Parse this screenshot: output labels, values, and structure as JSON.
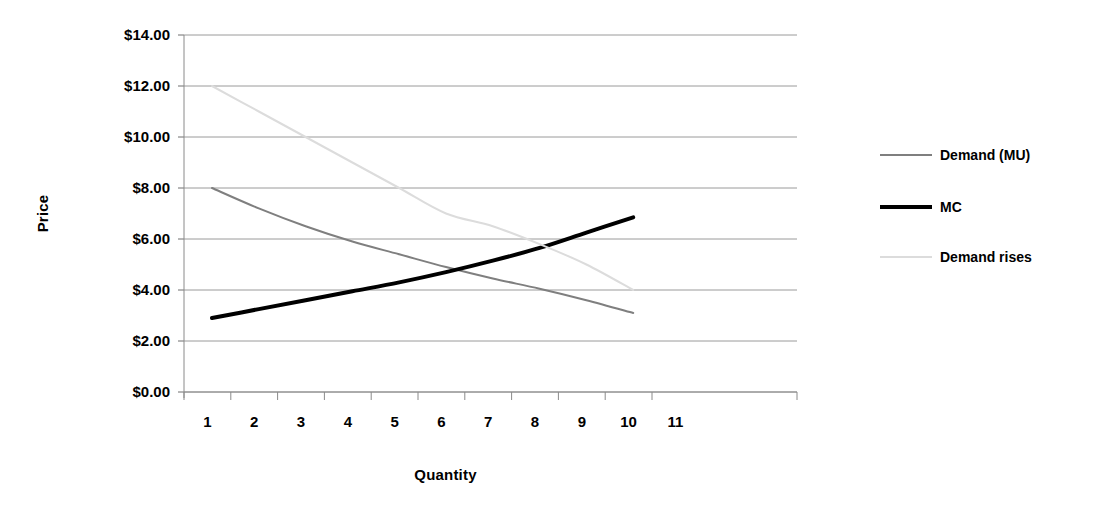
{
  "chart_data": {
    "type": "line",
    "title": "",
    "subtitle": "",
    "xlabel": "Quantity",
    "ylabel": "Price",
    "xlim": [
      1,
      11
    ],
    "ylim": [
      0,
      14
    ],
    "grid": true,
    "grid_axis": "y",
    "legend_position": "right",
    "x": [
      1,
      2,
      3,
      4,
      5,
      6,
      7,
      8,
      9,
      10
    ],
    "y_tick_labels": [
      "$0.00",
      "$2.00",
      "$4.00",
      "$6.00",
      "$8.00",
      "$10.00",
      "$12.00",
      "$14.00"
    ],
    "y_tick_values": [
      0,
      2,
      4,
      6,
      8,
      10,
      12,
      14
    ],
    "x_tick_labels": [
      "1",
      "2",
      "3",
      "4",
      "5",
      "6",
      "7",
      "8",
      "9",
      "10",
      "11"
    ],
    "x_tick_values": [
      1,
      2,
      3,
      4,
      5,
      6,
      7,
      8,
      9,
      10,
      11
    ],
    "series": [
      {
        "name": "Demand (MU)",
        "color": "#7f7f7f",
        "width": 2,
        "values": [
          8.0,
          7.2,
          6.5,
          5.9,
          5.4,
          4.9,
          4.45,
          4.05,
          3.6,
          3.1
        ]
      },
      {
        "name": "MC",
        "color": "#000000",
        "width": 4,
        "values": [
          2.9,
          3.25,
          3.6,
          3.95,
          4.3,
          4.7,
          5.15,
          5.65,
          6.25,
          6.85
        ]
      },
      {
        "name": "Demand rises",
        "color": "#dcdcdc",
        "width": 2,
        "values": [
          12.0,
          11.0,
          10.0,
          9.0,
          8.0,
          7.0,
          6.5,
          5.8,
          5.0,
          4.0
        ]
      }
    ],
    "annotations": []
  },
  "legend": {
    "entries": [
      {
        "label": "Demand (MU)"
      },
      {
        "label": "MC"
      },
      {
        "label": "Demand rises"
      }
    ]
  },
  "axes": {
    "y_axis_title": "Price",
    "x_axis_title": "Quantity"
  }
}
